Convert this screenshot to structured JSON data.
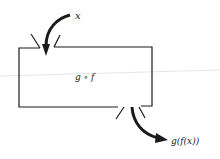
{
  "diagram": {
    "input_label": "x",
    "function_label": "g ∘ f",
    "output_label": "g(f(x))",
    "stroke_color": "#1a1a1a"
  }
}
